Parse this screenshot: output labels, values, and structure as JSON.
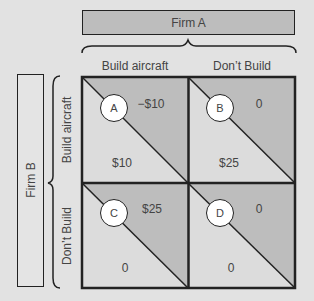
{
  "firm_a": {
    "label": "Firm A"
  },
  "firm_b": {
    "label": "Firm B"
  },
  "columns": [
    {
      "label": "Build aircraft"
    },
    {
      "label": "Don’t Build"
    }
  ],
  "rows": [
    {
      "label": "Build aircraft"
    },
    {
      "label": "Don’t Build"
    }
  ],
  "cells": [
    {
      "id": "A",
      "firm_a_payoff": "−$10",
      "firm_b_payoff": "$10"
    },
    {
      "id": "B",
      "firm_a_payoff": "0",
      "firm_b_payoff": "$25"
    },
    {
      "id": "C",
      "firm_a_payoff": "$25",
      "firm_b_payoff": "0"
    },
    {
      "id": "D",
      "firm_a_payoff": "0",
      "firm_b_payoff": "0"
    }
  ],
  "colors": {
    "background": "#e2e2e2",
    "upper_triangle": "#bdbdbd",
    "lower_triangle": "#dcdcdc",
    "border": "#222222"
  }
}
